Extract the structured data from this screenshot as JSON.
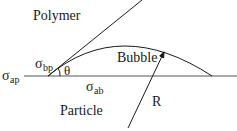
{
  "labels": {
    "polymer": "Polymer",
    "bubble": "Bubble",
    "particle": "Particle",
    "radius": "R",
    "theta": "θ",
    "sigma": "σ",
    "sub_bp": "bp",
    "sub_ap": "ap",
    "sub_ab": "ab"
  }
}
